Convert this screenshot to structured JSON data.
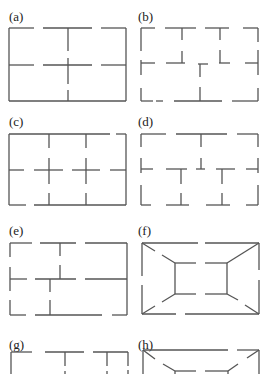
{
  "figure": {
    "panels": [
      {
        "id": "a",
        "label": "(a)",
        "description": "Rectangle divided into four by one dashed horizontal and one dashed vertical line"
      },
      {
        "id": "b",
        "label": "(b)",
        "description": "Dashed-outline rectangle with T-shaped partitions, two rooms on top and one below"
      },
      {
        "id": "c",
        "label": "(c)",
        "description": "Rectangle with a 3x2 grid of dashed partitions crossing at two points"
      },
      {
        "id": "d",
        "label": "(d)",
        "description": "Dashed-outline rectangle with staggered T-junction partitions"
      },
      {
        "id": "e",
        "label": "(e)",
        "description": "Rectangle with offset partitions forming unequal rooms"
      },
      {
        "id": "f",
        "label": "(f)",
        "description": "Rectangle with inner rectangle connected to corners by diagonal dashed lines"
      },
      {
        "id": "g",
        "label": "(g)",
        "description": "Rectangle with T-shaped partitions (partially visible)"
      },
      {
        "id": "h",
        "label": "(h)",
        "description": "Rectangle with inner rectangle connected by diagonals (partially visible)"
      }
    ]
  }
}
